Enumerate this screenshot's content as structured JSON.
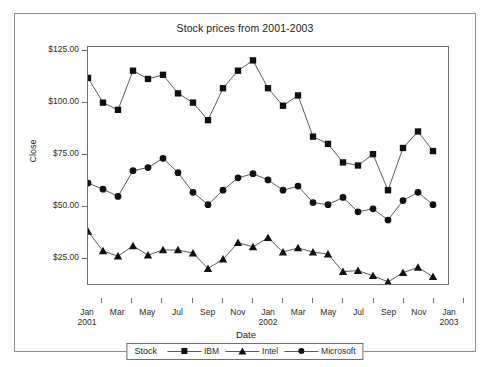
{
  "chart_data": {
    "type": "line",
    "title": "Stock prices from 2001-2003",
    "xlabel": "Date",
    "ylabel": "Close",
    "ylim": [
      12,
      127
    ],
    "yticks": [
      25,
      50,
      75,
      100,
      125
    ],
    "ytick_labels": [
      "$25.00",
      "$50.00",
      "$75.00",
      "$100.00",
      "$125.00"
    ],
    "grid": false,
    "legend_position": "bottom",
    "legend_title": "Stock",
    "x": [
      "Jan 2001",
      "Feb 2001",
      "Mar 2001",
      "Apr 2001",
      "May 2001",
      "Jun 2001",
      "Jul 2001",
      "Aug 2001",
      "Sep 2001",
      "Oct 2001",
      "Nov 2001",
      "Dec 2001",
      "Jan 2002",
      "Feb 2002",
      "Mar 2002",
      "Apr 2002",
      "May 2002",
      "Jun 2002",
      "Jul 2002",
      "Aug 2002",
      "Sep 2002",
      "Oct 2002",
      "Nov 2002",
      "Dec 2002",
      "Jan 2003"
    ],
    "xtick_labels": [
      {
        "month": "Jan",
        "year": "2001",
        "index": 0
      },
      {
        "month": "Mar",
        "year": "",
        "index": 2
      },
      {
        "month": "May",
        "year": "",
        "index": 4
      },
      {
        "month": "Jul",
        "year": "",
        "index": 6
      },
      {
        "month": "Sep",
        "year": "",
        "index": 8
      },
      {
        "month": "Nov",
        "year": "",
        "index": 10
      },
      {
        "month": "Jan",
        "year": "2002",
        "index": 12
      },
      {
        "month": "Mar",
        "year": "",
        "index": 14
      },
      {
        "month": "May",
        "year": "",
        "index": 16
      },
      {
        "month": "Jul",
        "year": "",
        "index": 18
      },
      {
        "month": "Sep",
        "year": "",
        "index": 20
      },
      {
        "month": "Nov",
        "year": "",
        "index": 22
      },
      {
        "month": "Jan",
        "year": "2003",
        "index": 24
      }
    ],
    "series": [
      {
        "name": "IBM",
        "marker": "square",
        "color": "#111111",
        "values": [
          112.0,
          100.0,
          96.5,
          115.5,
          111.5,
          113.5,
          104.5,
          100.0,
          91.5,
          107.0,
          115.5,
          120.5,
          107.0,
          98.5,
          103.5,
          83.5,
          80.0,
          71.0,
          69.5,
          75.0,
          57.5,
          78.0,
          86.0,
          76.5,
          null
        ]
      },
      {
        "name": "Intel",
        "marker": "triangle",
        "color": "#111111",
        "values": [
          37.5,
          28.0,
          25.5,
          30.5,
          26.0,
          28.5,
          28.5,
          27.0,
          19.5,
          24.0,
          32.0,
          30.0,
          34.5,
          27.5,
          29.5,
          27.5,
          26.5,
          18.0,
          18.5,
          16.0,
          13.0,
          17.5,
          20.0,
          15.5,
          null
        ]
      },
      {
        "name": "Microsoft",
        "marker": "circle",
        "color": "#111111",
        "values": [
          61.0,
          58.0,
          54.5,
          67.0,
          68.5,
          73.0,
          66.0,
          56.5,
          50.5,
          57.5,
          63.5,
          65.5,
          62.5,
          57.5,
          59.5,
          51.5,
          50.5,
          54.0,
          47.0,
          48.5,
          43.0,
          52.5,
          56.5,
          50.5,
          null
        ]
      }
    ]
  },
  "legend": {
    "title": "Stock",
    "entries": [
      {
        "label": "IBM",
        "marker": "square"
      },
      {
        "label": "Intel",
        "marker": "triangle"
      },
      {
        "label": "Microsoft",
        "marker": "circle"
      }
    ]
  }
}
